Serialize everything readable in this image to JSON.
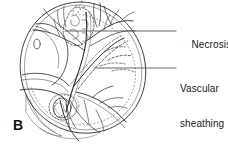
{
  "figure": {
    "panel_letter": "B",
    "drawing_name": "retinal-fundus-illustration",
    "line_color": "#2b2b2b",
    "background_color": "#ffffff",
    "leader_color": "#555555"
  },
  "labels": [
    {
      "id": "necrosis",
      "text": "Necrosis",
      "leader_from_x": 65,
      "leader_from_y": 31,
      "leader_to_x": 176,
      "leader_to_y": 31
    },
    {
      "id": "vascular-sheathing",
      "line1": "Vascular",
      "line2": "sheathing",
      "leader_from_x": 95,
      "leader_from_y": 68,
      "leader_to_x": 176,
      "leader_to_y": 68
    }
  ]
}
